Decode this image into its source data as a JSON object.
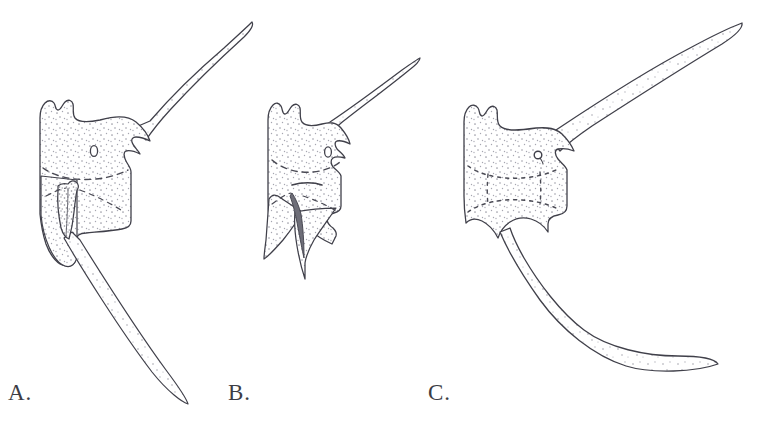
{
  "plate": {
    "background_color": "#ffffff",
    "ink_color": "#40404a",
    "stipple_color": "#8c8c96",
    "dash_color": "#4a4a54",
    "width": 765,
    "height": 430,
    "caption": ""
  },
  "panels": [
    {
      "id": "A",
      "label": "A.",
      "label_x": 8,
      "label_y": 381,
      "description": "Dinoflagellate cyst in lateral view with long curved apical horn directed upper-right and long curved antapical horn directed lower-right; sulcal groove visible on left flank",
      "body": {
        "outline_kind": "polygonal-cyst-body",
        "stippled": true,
        "pore": {
          "shape": "oval",
          "cx": 94,
          "cy": 151,
          "rx": 3.6,
          "ry": 5.4
        },
        "paratabulation": "dashed cingulum arc and dashed sulcal rays"
      },
      "apical_horn": {
        "direction": "upper-right",
        "tip_x": 252,
        "tip_y": 22,
        "curved": true,
        "tapered": true
      },
      "antapical_horn": {
        "direction": "lower-right",
        "tip_x": 188,
        "tip_y": 404,
        "curved": true,
        "tapered": true
      }
    },
    {
      "id": "B",
      "label": "B.",
      "label_x": 228,
      "label_y": 381,
      "description": "Dinoflagellate cyst with short straight apical horn directed upper-right and two pointed antapical horns separated by a deep V-shaped notch",
      "body": {
        "outline_kind": "polygonal-cyst-body",
        "stippled": true,
        "pore": {
          "shape": "oval",
          "cx": 328,
          "cy": 152,
          "rx": 3.4,
          "ry": 5.2
        },
        "paratabulation": "dashed cingulum arc, short solid dash below, dashed sulcal rays"
      },
      "apical_horn": {
        "direction": "upper-right",
        "tip_x": 420,
        "tip_y": 58,
        "curved": false,
        "tapered": true
      },
      "antapical_horns": [
        {
          "direction": "lower-left",
          "tip_x": 264,
          "tip_y": 259
        },
        {
          "direction": "lower-center",
          "tip_x": 305,
          "tip_y": 279
        }
      ]
    },
    {
      "id": "C",
      "label": "C.",
      "label_x": 428,
      "label_y": 381,
      "description": "Dinoflagellate cyst with very long curved apical horn directed upper-right and very long curved antapical horn directed lower-right; rectangular body with dotted paratabulation outlining the archeopyle",
      "body": {
        "outline_kind": "rectangular-cyst-body",
        "stippled": true,
        "pore": {
          "shape": "circle-with-tail",
          "cx": 538,
          "cy": 155,
          "rx": 4.0,
          "ry": 4.0
        },
        "paratabulation": "dotted cingulum arcs and dotted vertical archeopyle margins"
      },
      "apical_horn": {
        "direction": "upper-right",
        "tip_x": 742,
        "tip_y": 23,
        "curved": true,
        "tapered": true
      },
      "antapical_horn": {
        "direction": "lower-right",
        "tip_x": 718,
        "tip_y": 364,
        "curved": true,
        "tapered": true
      }
    }
  ]
}
